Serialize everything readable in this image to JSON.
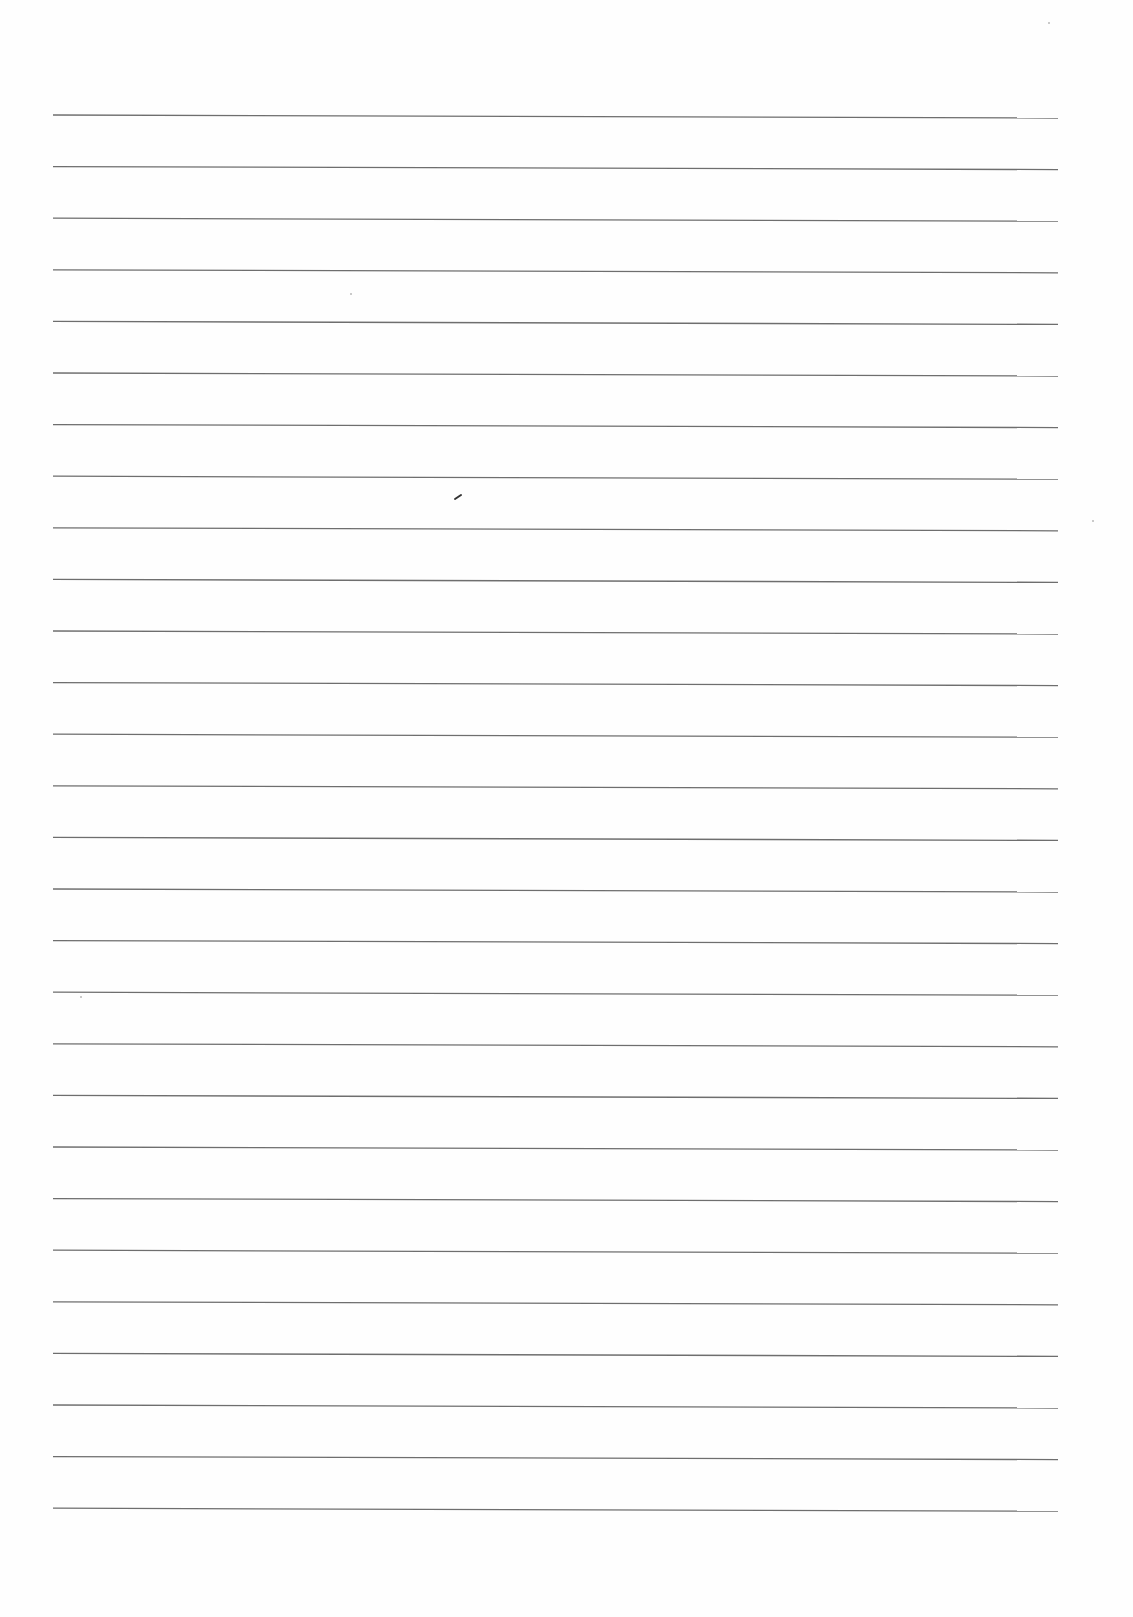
{
  "document": {
    "type": "ruled-paper",
    "content_text": "",
    "line_count": 28,
    "line_color": "#6e6e6e",
    "paper_color": "#fefefe",
    "rules": {
      "x_start": 53,
      "x_end": 1058,
      "first_y": 115,
      "spacing": 51.6,
      "slope_drop_right": 3
    },
    "marks": [
      {
        "type": "pen-mark",
        "x": 458,
        "y": 497
      }
    ]
  }
}
